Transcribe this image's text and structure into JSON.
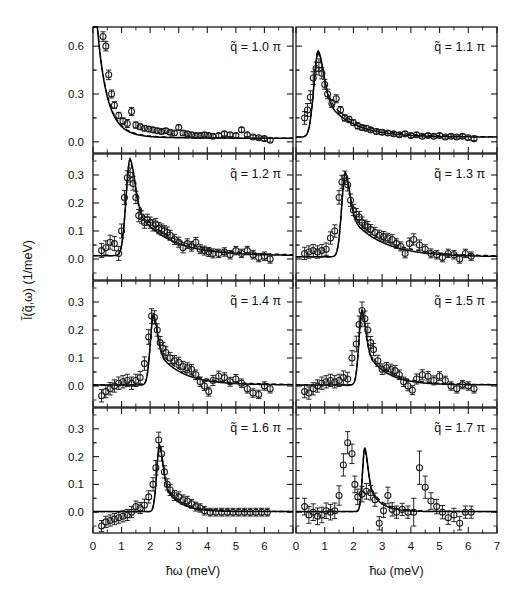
{
  "figure": {
    "xlabel": "ħω  (meV)",
    "ylabel": "Ĩ(q̃,ω)  (1/meV)",
    "xlim": [
      0,
      7
    ],
    "x_ticks_major": [
      0,
      1,
      2,
      3,
      4,
      5,
      6,
      7
    ],
    "x_ticklabels_left": [
      "0",
      "1",
      "2",
      "3",
      "4",
      "5",
      "6",
      ""
    ],
    "x_ticklabels_right": [
      "0",
      "1",
      "2",
      "3",
      "4",
      "5",
      "6",
      "7"
    ],
    "grid": false,
    "legend": "none",
    "marker": "open-circle",
    "curves": [
      "solid-fit",
      "dashed-fit"
    ]
  },
  "chart_data": [
    {
      "type": "scatter",
      "panel_index": 0,
      "row": 0,
      "col": 0,
      "label": "q̃ = 1.0  π",
      "q_value": 1.0,
      "q_unit": "π",
      "title": "",
      "xlabel": "ħω  (meV)",
      "ylabel": "Ĩ(q̃,ω)  (1/meV)",
      "xlim": [
        0,
        7
      ],
      "ylim": [
        -0.07,
        0.72
      ],
      "y_ticks": [
        0.0,
        0.3,
        0.6
      ],
      "y_ticklabels": [
        "0.0",
        "0.3",
        "0.6"
      ],
      "x": [
        0.35,
        0.45,
        0.55,
        0.65,
        0.75,
        0.9,
        1.05,
        1.2,
        1.35,
        1.5,
        1.65,
        1.8,
        1.95,
        2.1,
        2.25,
        2.4,
        2.55,
        2.7,
        2.85,
        3.0,
        3.15,
        3.3,
        3.45,
        3.6,
        3.75,
        3.9,
        4.05,
        4.2,
        4.4,
        4.6,
        4.8,
        5.0,
        5.2,
        5.4,
        5.6,
        5.8,
        6.0,
        6.2
      ],
      "y": [
        0.66,
        0.6,
        0.42,
        0.3,
        0.23,
        0.165,
        0.13,
        0.115,
        0.19,
        0.105,
        0.095,
        0.085,
        0.08,
        0.075,
        0.07,
        0.065,
        0.07,
        0.06,
        0.055,
        0.09,
        0.055,
        0.05,
        0.045,
        0.04,
        0.04,
        0.045,
        0.04,
        0.035,
        0.04,
        0.05,
        0.045,
        0.04,
        0.075,
        0.045,
        0.03,
        0.025,
        0.02,
        0.01
      ],
      "yerr": [
        0.03,
        0.03,
        0.03,
        0.025,
        0.022,
        0.02,
        0.02,
        0.025,
        0.025,
        0.02,
        0.018,
        0.016,
        0.016,
        0.015,
        0.015,
        0.015,
        0.014,
        0.014,
        0.014,
        0.016,
        0.014,
        0.013,
        0.013,
        0.013,
        0.013,
        0.013,
        0.012,
        0.012,
        0.012,
        0.013,
        0.012,
        0.012,
        0.015,
        0.012,
        0.012,
        0.012,
        0.012,
        0.012
      ],
      "fit_peak_x": 0.0,
      "fit_peak_y": 1.05,
      "fit_shape": "decay",
      "fit_width": 0.42,
      "fit_baseline": 0.022
    },
    {
      "type": "scatter",
      "panel_index": 1,
      "row": 0,
      "col": 1,
      "label": "q̃ = 1.1  π",
      "q_value": 1.1,
      "q_unit": "π",
      "xlim": [
        0,
        7
      ],
      "ylim": [
        -0.07,
        0.72
      ],
      "y_ticks": [
        0.0,
        0.3,
        0.6
      ],
      "y_ticklabels": [
        "",
        "",
        ""
      ],
      "x": [
        0.3,
        0.4,
        0.5,
        0.6,
        0.7,
        0.8,
        0.9,
        1.0,
        1.1,
        1.25,
        1.4,
        1.55,
        1.7,
        1.85,
        2.0,
        2.15,
        2.3,
        2.45,
        2.6,
        2.8,
        3.0,
        3.2,
        3.4,
        3.6,
        3.8,
        4.0,
        4.2,
        4.4,
        4.6,
        4.8,
        5.0,
        5.2,
        5.4,
        5.6,
        5.8,
        6.0,
        6.2
      ],
      "y": [
        0.15,
        0.2,
        0.28,
        0.4,
        0.46,
        0.48,
        0.43,
        0.36,
        0.3,
        0.24,
        0.27,
        0.2,
        0.15,
        0.14,
        0.12,
        0.1,
        0.09,
        0.085,
        0.075,
        0.065,
        0.06,
        0.055,
        0.05,
        0.045,
        0.05,
        0.04,
        0.045,
        0.035,
        0.04,
        0.035,
        0.04,
        0.03,
        0.035,
        0.03,
        0.035,
        0.025,
        0.02
      ],
      "yerr": [
        0.04,
        0.04,
        0.04,
        0.04,
        0.04,
        0.04,
        0.035,
        0.03,
        0.03,
        0.025,
        0.025,
        0.022,
        0.02,
        0.02,
        0.018,
        0.018,
        0.016,
        0.016,
        0.015,
        0.015,
        0.014,
        0.014,
        0.013,
        0.013,
        0.013,
        0.013,
        0.013,
        0.012,
        0.012,
        0.012,
        0.012,
        0.012,
        0.012,
        0.012,
        0.012,
        0.012,
        0.012
      ],
      "fit_peak_x": 0.78,
      "fit_peak_y": 0.54,
      "fit_shape": "asym-peak",
      "fit_width": 0.22,
      "fit_tail": 0.95,
      "fit_baseline": 0.03
    },
    {
      "type": "scatter",
      "panel_index": 2,
      "row": 1,
      "col": 0,
      "label": "q̃ = 1.2  π",
      "q_value": 1.2,
      "q_unit": "π",
      "xlim": [
        0,
        7
      ],
      "ylim": [
        -0.075,
        0.375
      ],
      "y_ticks": [
        0.0,
        0.1,
        0.2,
        0.3
      ],
      "y_ticklabels": [
        "0.0",
        "0.1",
        "0.2",
        "0.3"
      ],
      "x": [
        0.3,
        0.45,
        0.6,
        0.75,
        0.9,
        1.0,
        1.1,
        1.2,
        1.3,
        1.4,
        1.5,
        1.6,
        1.7,
        1.8,
        1.9,
        2.0,
        2.1,
        2.2,
        2.3,
        2.4,
        2.5,
        2.6,
        2.7,
        2.85,
        3.0,
        3.15,
        3.3,
        3.45,
        3.6,
        3.75,
        3.9,
        4.05,
        4.2,
        4.4,
        4.6,
        4.8,
        5.0,
        5.2,
        5.4,
        5.6,
        5.8,
        6.0,
        6.2
      ],
      "y": [
        0.03,
        0.04,
        0.06,
        0.055,
        0.02,
        0.1,
        0.22,
        0.29,
        0.3,
        0.27,
        0.22,
        0.155,
        0.15,
        0.13,
        0.14,
        0.13,
        0.12,
        0.125,
        0.11,
        0.105,
        0.1,
        0.095,
        0.085,
        0.07,
        0.06,
        0.04,
        0.055,
        0.045,
        0.06,
        0.035,
        0.03,
        0.025,
        0.02,
        0.02,
        0.025,
        0.015,
        0.03,
        0.02,
        0.03,
        0.015,
        0.005,
        0.01,
        0.0
      ],
      "yerr": [
        0.025,
        0.025,
        0.025,
        0.025,
        0.025,
        0.025,
        0.025,
        0.025,
        0.025,
        0.024,
        0.022,
        0.022,
        0.022,
        0.02,
        0.02,
        0.02,
        0.02,
        0.02,
        0.02,
        0.02,
        0.019,
        0.019,
        0.018,
        0.018,
        0.018,
        0.018,
        0.017,
        0.017,
        0.017,
        0.016,
        0.016,
        0.016,
        0.016,
        0.015,
        0.015,
        0.015,
        0.015,
        0.015,
        0.015,
        0.015,
        0.015,
        0.015,
        0.015
      ],
      "fit_peak_x": 1.3,
      "fit_peak_y": 0.345,
      "fit_shape": "asym-peak",
      "fit_width": 0.2,
      "fit_tail": 1.15,
      "fit_baseline": 0.012
    },
    {
      "type": "scatter",
      "panel_index": 3,
      "row": 1,
      "col": 1,
      "label": "q̃ = 1.3  π",
      "q_value": 1.3,
      "q_unit": "π",
      "xlim": [
        0,
        7
      ],
      "ylim": [
        -0.075,
        0.375
      ],
      "y_ticks": [
        0.0,
        0.1,
        0.2,
        0.3
      ],
      "y_ticklabels": [
        "",
        "",
        "",
        ""
      ],
      "x": [
        0.3,
        0.45,
        0.6,
        0.75,
        0.9,
        1.05,
        1.2,
        1.35,
        1.5,
        1.6,
        1.7,
        1.8,
        1.9,
        2.0,
        2.1,
        2.2,
        2.3,
        2.4,
        2.5,
        2.6,
        2.75,
        2.9,
        3.05,
        3.2,
        3.35,
        3.5,
        3.65,
        3.8,
        3.95,
        4.1,
        4.3,
        4.5,
        4.7,
        4.9,
        5.1,
        5.3,
        5.5,
        5.7,
        5.9,
        6.1
      ],
      "y": [
        0.02,
        0.025,
        0.03,
        0.025,
        0.03,
        0.035,
        0.075,
        0.1,
        0.22,
        0.275,
        0.29,
        0.265,
        0.21,
        0.175,
        0.16,
        0.15,
        0.13,
        0.12,
        0.115,
        0.105,
        0.095,
        0.085,
        0.08,
        0.075,
        0.07,
        0.055,
        0.045,
        0.02,
        0.055,
        0.07,
        0.05,
        0.035,
        0.02,
        0.015,
        0.005,
        0.02,
        0.015,
        0.0,
        0.02,
        0.01
      ],
      "yerr": [
        0.022,
        0.022,
        0.022,
        0.022,
        0.022,
        0.022,
        0.022,
        0.022,
        0.024,
        0.024,
        0.024,
        0.022,
        0.022,
        0.02,
        0.02,
        0.02,
        0.02,
        0.019,
        0.019,
        0.018,
        0.018,
        0.018,
        0.018,
        0.017,
        0.017,
        0.017,
        0.016,
        0.016,
        0.02,
        0.02,
        0.018,
        0.016,
        0.016,
        0.015,
        0.015,
        0.015,
        0.015,
        0.015,
        0.015,
        0.015
      ],
      "fit_peak_x": 1.72,
      "fit_peak_y": 0.3,
      "fit_shape": "asym-peak",
      "fit_width": 0.18,
      "fit_tail": 1.1,
      "fit_baseline": 0.008
    },
    {
      "type": "scatter",
      "panel_index": 4,
      "row": 2,
      "col": 0,
      "label": "q̃ = 1.4  π",
      "q_value": 1.4,
      "q_unit": "π",
      "xlim": [
        0,
        7
      ],
      "ylim": [
        -0.075,
        0.375
      ],
      "y_ticks": [
        0.0,
        0.1,
        0.2,
        0.3
      ],
      "y_ticklabels": [
        "0.0",
        "0.1",
        "0.2",
        "0.3"
      ],
      "x": [
        0.3,
        0.45,
        0.6,
        0.75,
        0.9,
        1.05,
        1.2,
        1.35,
        1.5,
        1.65,
        1.8,
        1.95,
        2.05,
        2.15,
        2.25,
        2.35,
        2.45,
        2.55,
        2.7,
        2.85,
        3.0,
        3.15,
        3.3,
        3.45,
        3.6,
        3.75,
        3.9,
        4.05,
        4.2,
        4.4,
        4.6,
        4.8,
        5.0,
        5.2,
        5.4,
        5.6,
        5.8,
        6.0,
        6.2
      ],
      "y": [
        -0.035,
        -0.02,
        -0.01,
        0.0,
        0.01,
        0.015,
        0.02,
        0.01,
        0.02,
        0.03,
        0.08,
        0.175,
        0.25,
        0.245,
        0.2,
        0.155,
        0.135,
        0.12,
        0.1,
        0.09,
        0.085,
        0.07,
        0.065,
        0.06,
        0.04,
        0.015,
        0.0,
        -0.02,
        0.02,
        0.035,
        0.03,
        0.015,
        0.025,
        0.01,
        -0.01,
        -0.025,
        -0.03,
        0.0,
        -0.01
      ],
      "yerr": [
        0.022,
        0.022,
        0.022,
        0.022,
        0.022,
        0.022,
        0.022,
        0.022,
        0.022,
        0.022,
        0.024,
        0.026,
        0.026,
        0.024,
        0.022,
        0.022,
        0.02,
        0.02,
        0.02,
        0.019,
        0.018,
        0.018,
        0.018,
        0.017,
        0.017,
        0.017,
        0.016,
        0.016,
        0.018,
        0.018,
        0.017,
        0.016,
        0.016,
        0.015,
        0.015,
        0.015,
        0.015,
        0.015,
        0.015
      ],
      "fit_peak_x": 2.12,
      "fit_peak_y": 0.25,
      "fit_shape": "asym-peak",
      "fit_width": 0.16,
      "fit_tail": 0.85,
      "fit_baseline": 0.004
    },
    {
      "type": "scatter",
      "panel_index": 5,
      "row": 2,
      "col": 1,
      "label": "q̃ = 1.5  π",
      "q_value": 1.5,
      "q_unit": "π",
      "xlim": [
        0,
        7
      ],
      "ylim": [
        -0.075,
        0.375
      ],
      "y_ticks": [
        0.0,
        0.1,
        0.2,
        0.3
      ],
      "y_ticklabels": [
        "",
        "",
        "",
        ""
      ],
      "x": [
        0.3,
        0.45,
        0.6,
        0.75,
        0.9,
        1.05,
        1.2,
        1.35,
        1.5,
        1.65,
        1.8,
        1.95,
        2.1,
        2.2,
        2.3,
        2.4,
        2.5,
        2.6,
        2.7,
        2.85,
        3.0,
        3.15,
        3.3,
        3.45,
        3.6,
        3.75,
        3.9,
        4.05,
        4.2,
        4.4,
        4.6,
        4.8,
        5.0,
        5.2,
        5.4,
        5.6,
        5.8,
        6.0,
        6.2
      ],
      "y": [
        -0.02,
        -0.025,
        -0.01,
        0.0,
        0.01,
        0.015,
        0.02,
        0.015,
        0.02,
        0.03,
        0.025,
        0.1,
        0.15,
        0.22,
        0.27,
        0.24,
        0.2,
        0.155,
        0.13,
        0.09,
        0.06,
        0.065,
        0.06,
        0.055,
        0.04,
        0.015,
        0.0,
        -0.015,
        0.025,
        0.04,
        0.035,
        0.02,
        0.035,
        0.02,
        0.0,
        -0.01,
        0.005,
        0.0,
        -0.01
      ],
      "yerr": [
        0.022,
        0.022,
        0.022,
        0.022,
        0.022,
        0.022,
        0.022,
        0.022,
        0.022,
        0.024,
        0.024,
        0.026,
        0.028,
        0.03,
        0.03,
        0.028,
        0.024,
        0.022,
        0.022,
        0.02,
        0.019,
        0.019,
        0.018,
        0.018,
        0.017,
        0.017,
        0.017,
        0.016,
        0.018,
        0.018,
        0.017,
        0.016,
        0.016,
        0.015,
        0.015,
        0.015,
        0.015,
        0.015,
        0.015
      ],
      "fit_peak_x": 2.3,
      "fit_peak_y": 0.265,
      "fit_shape": "asym-peak",
      "fit_width": 0.15,
      "fit_tail": 0.7,
      "fit_baseline": 0.004
    },
    {
      "type": "scatter",
      "panel_index": 6,
      "row": 3,
      "col": 0,
      "label": "q̃ = 1.6  π",
      "q_value": 1.6,
      "q_unit": "π",
      "xlim": [
        0,
        7
      ],
      "ylim": [
        -0.075,
        0.375
      ],
      "y_ticks": [
        0.0,
        0.1,
        0.2,
        0.3
      ],
      "y_ticklabels": [
        "0.0",
        "0.1",
        "0.2",
        "0.3"
      ],
      "x": [
        0.3,
        0.45,
        0.6,
        0.75,
        0.9,
        1.05,
        1.2,
        1.35,
        1.5,
        1.65,
        1.8,
        1.95,
        2.1,
        2.2,
        2.3,
        2.4,
        2.5,
        2.6,
        2.7,
        2.85,
        3.0,
        3.15,
        3.3,
        3.45,
        3.6,
        3.75,
        3.9,
        4.1,
        4.3,
        4.5,
        4.7,
        4.9,
        5.1,
        5.3,
        5.5,
        5.7,
        5.9,
        6.1
      ],
      "y": [
        -0.05,
        -0.035,
        -0.03,
        -0.025,
        -0.02,
        -0.015,
        -0.01,
        0.0,
        0.02,
        0.015,
        0.025,
        0.055,
        0.1,
        0.16,
        0.26,
        0.21,
        0.145,
        0.1,
        0.08,
        0.06,
        0.055,
        0.045,
        0.04,
        0.03,
        0.02,
        0.015,
        0.005,
        0.0,
        0.0,
        0.0,
        0.0,
        0.0,
        0.0,
        0.0,
        0.0,
        0.0,
        0.0,
        0.0
      ],
      "yerr": [
        0.02,
        0.02,
        0.02,
        0.02,
        0.02,
        0.02,
        0.02,
        0.02,
        0.02,
        0.02,
        0.022,
        0.022,
        0.024,
        0.026,
        0.028,
        0.026,
        0.022,
        0.02,
        0.02,
        0.018,
        0.018,
        0.017,
        0.017,
        0.016,
        0.016,
        0.015,
        0.015,
        0.014,
        0.014,
        0.014,
        0.014,
        0.014,
        0.014,
        0.014,
        0.014,
        0.014,
        0.014,
        0.014
      ],
      "fit_peak_x": 2.33,
      "fit_peak_y": 0.24,
      "fit_shape": "asym-peak",
      "fit_width": 0.14,
      "fit_tail": 0.5,
      "fit_baseline": 0.002
    },
    {
      "type": "scatter",
      "panel_index": 7,
      "row": 3,
      "col": 1,
      "label": "q̃ = 1.7  π",
      "q_value": 1.7,
      "q_unit": "π",
      "xlim": [
        0,
        7
      ],
      "ylim": [
        -0.075,
        0.375
      ],
      "y_ticks": [
        0.0,
        0.1,
        0.2,
        0.3
      ],
      "y_ticklabels": [
        "",
        "",
        "",
        ""
      ],
      "x": [
        0.3,
        0.45,
        0.6,
        0.75,
        0.9,
        1.05,
        1.2,
        1.35,
        1.5,
        1.65,
        1.8,
        1.95,
        2.05,
        2.15,
        2.3,
        2.45,
        2.6,
        2.75,
        2.9,
        3.05,
        3.2,
        3.35,
        3.5,
        3.7,
        3.9,
        4.1,
        4.3,
        4.5,
        4.7,
        4.9,
        5.1,
        5.3,
        5.5,
        5.7,
        5.9,
        6.1
      ],
      "y": [
        0.02,
        -0.01,
        0.0,
        -0.015,
        -0.01,
        0.005,
        0.0,
        0.005,
        0.06,
        0.17,
        0.25,
        0.21,
        0.1,
        0.055,
        0.065,
        0.075,
        0.07,
        0.045,
        -0.04,
        0.005,
        0.06,
        0.01,
        0.0,
        0.01,
        0.0,
        0.0,
        0.16,
        0.09,
        0.04,
        0.02,
        0.0,
        -0.02,
        -0.01,
        -0.04,
        0.0,
        0.0
      ],
      "yerr": [
        0.03,
        0.03,
        0.03,
        0.03,
        0.028,
        0.028,
        0.028,
        0.028,
        0.035,
        0.04,
        0.04,
        0.035,
        0.03,
        0.028,
        0.028,
        0.028,
        0.026,
        0.024,
        0.024,
        0.024,
        0.03,
        0.024,
        0.022,
        0.022,
        0.022,
        0.05,
        0.06,
        0.04,
        0.03,
        0.026,
        0.024,
        0.024,
        0.024,
        0.024,
        0.022,
        0.022
      ],
      "fit_peak_x": 2.4,
      "fit_peak_y": 0.23,
      "fit_shape": "asym-peak",
      "fit_width": 0.12,
      "fit_tail": 0.4,
      "fit_baseline": 0.002
    }
  ]
}
